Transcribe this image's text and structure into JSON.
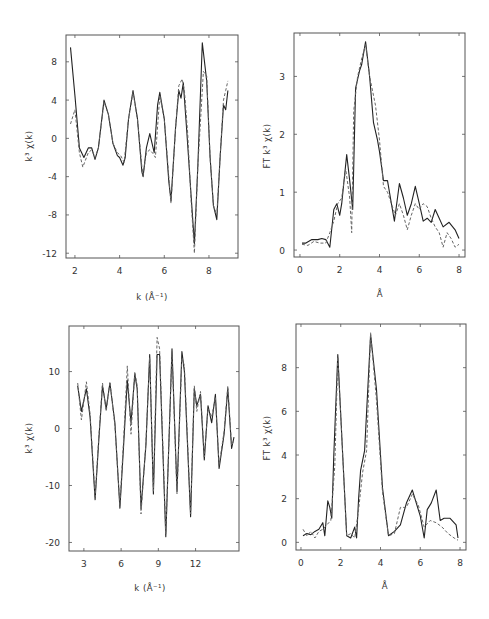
{
  "chart_data": [
    {
      "id": "top-left",
      "type": "line",
      "title": "",
      "xlabel": "k (Å⁻¹)",
      "ylabel": "k³ χ(k)",
      "xlim": [
        1.6,
        9.3
      ],
      "ylim": [
        -12.5,
        10.8
      ],
      "xticks": [
        2,
        4,
        6,
        8
      ],
      "yticks": [
        8,
        4,
        0,
        -4,
        -8,
        -12
      ],
      "ytick_labels": [
        "8",
        "4",
        "0",
        "-4",
        "-8",
        "-12"
      ],
      "box": [
        66,
        35,
        238,
        258
      ],
      "series": [
        {
          "name": "experimental",
          "style": "solid",
          "x": [
            1.8,
            2.0,
            2.2,
            2.4,
            2.6,
            2.75,
            2.9,
            3.05,
            3.3,
            3.5,
            3.7,
            3.9,
            4.0,
            4.15,
            4.25,
            4.4,
            4.6,
            4.8,
            5.0,
            5.05,
            5.2,
            5.35,
            5.45,
            5.55,
            5.7,
            5.8,
            6.0,
            6.2,
            6.3,
            6.5,
            6.65,
            6.75,
            6.85,
            7.0,
            7.2,
            7.35,
            7.5,
            7.7,
            7.9,
            8.05,
            8.2,
            8.35,
            8.5,
            8.65,
            8.75,
            8.85
          ],
          "y": [
            9.5,
            4.5,
            -1.0,
            -2.0,
            -1.0,
            -1.0,
            -2.2,
            -1.0,
            4.0,
            2.5,
            -0.5,
            -1.8,
            -2.0,
            -2.8,
            -2.0,
            2.0,
            5.0,
            2.0,
            -3.5,
            -4.0,
            -1.0,
            0.5,
            -0.5,
            -1.5,
            3.5,
            4.8,
            2.0,
            -4.5,
            -6.5,
            1.0,
            5.0,
            4.2,
            5.8,
            1.0,
            -6.0,
            -11.0,
            -3.0,
            10.0,
            6.0,
            -2.0,
            -7.0,
            -8.5,
            -2.0,
            3.5,
            3.0,
            5.0
          ]
        },
        {
          "name": "fit",
          "style": "dashed",
          "x": [
            1.8,
            2.0,
            2.2,
            2.35,
            2.6,
            2.75,
            2.9,
            3.05,
            3.3,
            3.5,
            3.7,
            3.9,
            4.05,
            4.2,
            4.4,
            4.6,
            4.8,
            5.0,
            5.05,
            5.2,
            5.35,
            5.5,
            5.6,
            5.8,
            6.0,
            6.2,
            6.3,
            6.5,
            6.65,
            6.8,
            6.9,
            7.05,
            7.2,
            7.35,
            7.5,
            7.75,
            7.9,
            8.05,
            8.2,
            8.35,
            8.5,
            8.65,
            8.75,
            8.85
          ],
          "y": [
            1.5,
            3.0,
            -1.5,
            -3.0,
            -1.5,
            -1.2,
            -2.0,
            -1.0,
            3.8,
            2.5,
            -0.5,
            -1.5,
            -1.8,
            -2.5,
            2.0,
            4.8,
            2.0,
            -3.0,
            -3.8,
            -1.5,
            -1.2,
            -1.6,
            -2.0,
            4.5,
            2.0,
            -4.0,
            -6.8,
            1.0,
            5.5,
            6.2,
            5.0,
            0.5,
            -6.5,
            -12.0,
            -3.0,
            7.0,
            6.5,
            -2.0,
            -7.0,
            -8.0,
            -2.0,
            4.0,
            5.0,
            6.0
          ]
        }
      ]
    },
    {
      "id": "top-right",
      "type": "line",
      "title": "",
      "xlabel": "Å",
      "ylabel": "FT k³ χ(k)",
      "xlim": [
        -0.3,
        8.3
      ],
      "ylim": [
        -0.12,
        3.75
      ],
      "xticks": [
        0,
        2,
        4,
        6,
        8
      ],
      "yticks": [
        0,
        1,
        2,
        3
      ],
      "box": [
        294,
        33,
        465,
        257
      ],
      "series": [
        {
          "name": "experimental",
          "style": "solid",
          "x": [
            0.1,
            0.3,
            0.6,
            0.9,
            1.1,
            1.3,
            1.5,
            1.7,
            1.85,
            2.0,
            2.1,
            2.35,
            2.5,
            2.65,
            2.8,
            3.0,
            3.1,
            3.3,
            3.5,
            3.7,
            3.9,
            4.0,
            4.2,
            4.4,
            4.6,
            4.75,
            5.0,
            5.2,
            5.4,
            5.6,
            5.8,
            6.0,
            6.2,
            6.4,
            6.6,
            6.8,
            7.0,
            7.2,
            7.5,
            7.8,
            8.0
          ],
          "y": [
            0.12,
            0.12,
            0.18,
            0.18,
            0.2,
            0.18,
            0.05,
            0.7,
            0.8,
            0.6,
            0.8,
            1.65,
            1.2,
            0.7,
            2.8,
            3.1,
            3.2,
            3.6,
            3.0,
            2.2,
            1.9,
            1.7,
            1.2,
            1.2,
            0.8,
            0.5,
            1.15,
            0.9,
            0.6,
            0.8,
            1.1,
            0.8,
            0.5,
            0.55,
            0.48,
            0.7,
            0.55,
            0.4,
            0.48,
            0.35,
            0.2
          ]
        },
        {
          "name": "fit",
          "style": "dashed",
          "x": [
            0.1,
            0.4,
            0.7,
            1.0,
            1.3,
            1.5,
            1.7,
            1.9,
            2.1,
            2.3,
            2.5,
            2.6,
            2.7,
            2.9,
            3.1,
            3.3,
            3.5,
            3.8,
            4.0,
            4.2,
            4.4,
            4.6,
            4.8,
            5.0,
            5.2,
            5.4,
            5.6,
            5.8,
            6.0,
            6.2,
            6.4,
            6.6,
            6.8,
            7.0,
            7.2,
            7.4,
            7.6,
            7.8,
            8.0
          ],
          "y": [
            0.1,
            0.08,
            0.15,
            0.12,
            0.12,
            0.3,
            0.5,
            0.8,
            0.9,
            1.4,
            0.9,
            0.3,
            2.4,
            3.0,
            3.3,
            3.55,
            3.0,
            2.5,
            1.9,
            1.1,
            1.0,
            0.8,
            0.6,
            0.8,
            0.6,
            0.35,
            0.6,
            0.8,
            0.7,
            0.8,
            0.75,
            0.55,
            0.4,
            0.3,
            0.05,
            0.3,
            0.2,
            0.05,
            0.1
          ]
        }
      ]
    },
    {
      "id": "bottom-left",
      "type": "line",
      "title": "",
      "xlabel": "k (Å⁻¹)",
      "ylabel": "k³ χ(k)",
      "xlim": [
        1.8,
        15.5
      ],
      "ylim": [
        -21.5,
        18.0
      ],
      "xticks": [
        3,
        6,
        9,
        12
      ],
      "yticks": [
        10,
        0,
        -10,
        -20
      ],
      "ytick_labels": [
        "10",
        "0",
        "-10",
        "-20"
      ],
      "box": [
        69,
        326,
        239,
        551
      ],
      "series": [
        {
          "name": "experimental",
          "style": "solid",
          "x": [
            2.5,
            2.8,
            3.2,
            3.5,
            3.9,
            4.2,
            4.5,
            4.8,
            5.1,
            5.5,
            5.9,
            6.2,
            6.5,
            6.8,
            7.1,
            7.3,
            7.6,
            8.0,
            8.3,
            8.6,
            8.9,
            9.1,
            9.6,
            10.1,
            10.5,
            10.9,
            11.1,
            11.6,
            11.9,
            12.1,
            12.4,
            12.7,
            13.0,
            13.3,
            13.6,
            13.9,
            14.3,
            14.6,
            14.9,
            15.1
          ],
          "y": [
            7.5,
            3.0,
            7.0,
            2.0,
            -12.5,
            -2.0,
            7.5,
            3.5,
            8.0,
            1.0,
            -14.0,
            -3.0,
            8.5,
            1.0,
            9.5,
            7.0,
            -14.0,
            -3.0,
            13.0,
            -11.5,
            13.0,
            13.0,
            -19.0,
            14.0,
            -11.0,
            13.5,
            10.0,
            -15.5,
            7.0,
            4.0,
            6.0,
            -5.5,
            4.0,
            1.0,
            6.0,
            -7.0,
            -1.0,
            7.0,
            -3.5,
            -1.5
          ]
        },
        {
          "name": "fit",
          "style": "dashed",
          "x": [
            2.5,
            2.8,
            3.2,
            3.5,
            3.9,
            4.2,
            4.5,
            4.8,
            5.1,
            5.5,
            5.9,
            6.2,
            6.5,
            6.8,
            7.1,
            7.3,
            7.6,
            8.0,
            8.3,
            8.6,
            8.9,
            9.1,
            9.6,
            10.1,
            10.5,
            10.9,
            11.1,
            11.6,
            11.9,
            12.1,
            12.4,
            12.7,
            13.0,
            13.3,
            13.6,
            13.9,
            14.3,
            14.6,
            14.9,
            15.1
          ],
          "y": [
            8.0,
            1.5,
            8.2,
            2.5,
            -12.0,
            -1.5,
            8.0,
            3.0,
            8.2,
            0.5,
            -13.5,
            -2.0,
            11.0,
            -1.0,
            10.0,
            7.5,
            -15.0,
            -2.5,
            12.5,
            -11.0,
            16.0,
            14.0,
            -18.5,
            13.5,
            -11.5,
            12.5,
            11.0,
            -15.0,
            7.5,
            3.0,
            6.5,
            -5.0,
            3.5,
            2.0,
            5.5,
            -6.5,
            -0.5,
            7.5,
            -3.0,
            -2.0
          ]
        }
      ]
    },
    {
      "id": "bottom-right",
      "type": "line",
      "title": "",
      "xlabel": "Å",
      "ylabel": "FT k³ χ(k)",
      "xlim": [
        -0.25,
        8.3
      ],
      "ylim": [
        -0.35,
        10.0
      ],
      "xticks": [
        0,
        2,
        4,
        6,
        8
      ],
      "yticks": [
        0,
        2,
        4,
        6,
        8
      ],
      "box": [
        296,
        324,
        466,
        550
      ],
      "series": [
        {
          "name": "experimental",
          "style": "solid",
          "x": [
            0.1,
            0.3,
            0.5,
            0.7,
            0.9,
            1.1,
            1.2,
            1.35,
            1.45,
            1.55,
            1.65,
            1.85,
            2.1,
            2.3,
            2.5,
            2.7,
            2.8,
            2.9,
            3.0,
            3.2,
            3.5,
            3.8,
            4.1,
            4.4,
            4.7,
            5.0,
            5.3,
            5.6,
            5.8,
            6.0,
            6.2,
            6.35,
            6.55,
            6.8,
            7.0,
            7.2,
            7.5,
            7.8,
            7.9
          ],
          "y": [
            0.3,
            0.4,
            0.35,
            0.5,
            0.6,
            0.9,
            0.3,
            1.9,
            1.6,
            1.1,
            4.0,
            8.6,
            4.0,
            0.3,
            0.2,
            0.7,
            0.2,
            2.0,
            3.3,
            4.2,
            9.5,
            7.0,
            2.5,
            0.3,
            0.5,
            0.8,
            1.8,
            2.4,
            1.8,
            1.2,
            0.2,
            1.5,
            1.8,
            2.4,
            1.0,
            1.1,
            1.1,
            0.8,
            0.2
          ]
        },
        {
          "name": "fit",
          "style": "dashed",
          "x": [
            0.1,
            0.3,
            0.5,
            0.7,
            0.9,
            1.1,
            1.3,
            1.5,
            1.7,
            1.85,
            2.1,
            2.3,
            2.5,
            2.7,
            2.9,
            3.1,
            3.3,
            3.5,
            3.8,
            4.1,
            4.4,
            4.7,
            5.0,
            5.3,
            5.6,
            5.9,
            6.2,
            6.5,
            6.8,
            7.1,
            7.4,
            7.7,
            7.9
          ],
          "y": [
            0.6,
            0.3,
            0.5,
            0.2,
            0.5,
            0.6,
            0.8,
            1.0,
            3.5,
            8.5,
            4.0,
            0.3,
            0.4,
            0.2,
            1.5,
            3.2,
            4.2,
            9.6,
            6.5,
            2.3,
            0.3,
            0.4,
            1.6,
            1.6,
            2.2,
            1.7,
            0.7,
            1.0,
            0.9,
            0.7,
            0.4,
            0.2,
            0.1
          ]
        }
      ]
    }
  ],
  "labels": {
    "tl_xlabel": "k (Å⁻¹)",
    "tl_ylabel": "k³ χ(k)",
    "tr_xlabel": "Å",
    "tr_ylabel": "FT k³ χ(k)",
    "bl_xlabel": "k (Å⁻¹)",
    "bl_ylabel": "k³ χ(k)",
    "br_xlabel": "Å",
    "br_ylabel": "FT k³ χ(k)"
  }
}
